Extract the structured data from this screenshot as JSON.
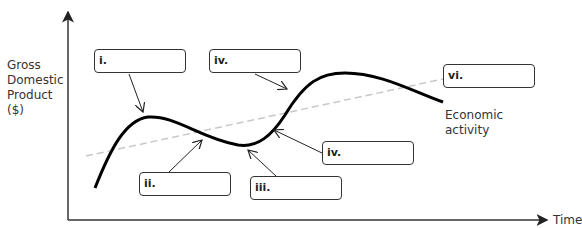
{
  "diagram": {
    "y_axis_label": [
      "Gross",
      "Domestic",
      "Product",
      "($)"
    ],
    "x_axis_label": "Time",
    "curve_label": [
      "Economic",
      "activity"
    ],
    "boxes": [
      {
        "id": "i",
        "label": "i."
      },
      {
        "id": "iv-top",
        "label": "iv."
      },
      {
        "id": "vi",
        "label": "vi."
      },
      {
        "id": "ii",
        "label": "ii."
      },
      {
        "id": "iii",
        "label": "iii."
      },
      {
        "id": "iv-bottom",
        "label": "iv."
      }
    ],
    "colors": {
      "curve": "#000000",
      "trend": "#c8c8c8",
      "axis": "#333333"
    }
  }
}
